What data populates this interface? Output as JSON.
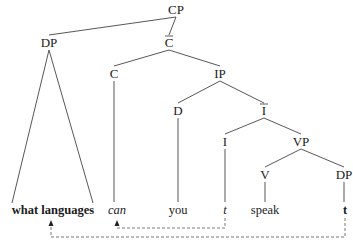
{
  "diagram": {
    "type": "syntax-tree",
    "nodes": [
      {
        "id": "CP",
        "label": "CP",
        "x": 176,
        "y": 14,
        "bar": false
      },
      {
        "id": "DP1",
        "label": "DP",
        "x": 49,
        "y": 47,
        "bar": false
      },
      {
        "id": "Cbar",
        "label": "C",
        "x": 169,
        "y": 47,
        "bar": true
      },
      {
        "id": "C",
        "label": "C",
        "x": 114,
        "y": 78,
        "bar": false
      },
      {
        "id": "IP",
        "label": "IP",
        "x": 220,
        "y": 78,
        "bar": false
      },
      {
        "id": "D",
        "label": "D",
        "x": 178,
        "y": 115,
        "bar": false
      },
      {
        "id": "Ibar",
        "label": "I",
        "x": 264,
        "y": 115,
        "bar": true
      },
      {
        "id": "I",
        "label": "I",
        "x": 225,
        "y": 146,
        "bar": false
      },
      {
        "id": "VP",
        "label": "VP",
        "x": 301,
        "y": 146,
        "bar": false
      },
      {
        "id": "V",
        "label": "V",
        "x": 265,
        "y": 179,
        "bar": false
      },
      {
        "id": "DP2",
        "label": "DP",
        "x": 344,
        "y": 179,
        "bar": false
      }
    ],
    "leaves": [
      {
        "id": "what-languages",
        "label": "what languages",
        "x": 53,
        "y": 214,
        "style": "bold"
      },
      {
        "id": "can",
        "label": "can",
        "x": 117,
        "y": 214,
        "style": "italic"
      },
      {
        "id": "you",
        "label": "you",
        "x": 178,
        "y": 214,
        "style": "normal"
      },
      {
        "id": "t-I",
        "label": "t",
        "x": 225,
        "y": 214,
        "style": "italic"
      },
      {
        "id": "speak",
        "label": "speak",
        "x": 265,
        "y": 214,
        "style": "normal"
      },
      {
        "id": "t-DP",
        "label": "t",
        "x": 345,
        "y": 214,
        "style": "bold"
      }
    ],
    "edges": [
      [
        "CP",
        "DP1"
      ],
      [
        "CP",
        "Cbar"
      ],
      [
        "Cbar",
        "C"
      ],
      [
        "Cbar",
        "IP"
      ],
      [
        "IP",
        "D"
      ],
      [
        "IP",
        "Ibar"
      ],
      [
        "Ibar",
        "I"
      ],
      [
        "Ibar",
        "VP"
      ],
      [
        "VP",
        "V"
      ],
      [
        "VP",
        "DP2"
      ]
    ],
    "triangle": {
      "apex": "DP1",
      "left_x": 12,
      "right_x": 93,
      "base_y": 203
    },
    "unary": [
      {
        "from": "C",
        "to": "can"
      },
      {
        "from": "D",
        "to": "you"
      },
      {
        "from": "I",
        "to": "t-I"
      },
      {
        "from": "V",
        "to": "speak"
      },
      {
        "from": "DP2",
        "to": "t-DP"
      }
    ],
    "movements": [
      {
        "from": "t-I",
        "to": "can",
        "line_y": 228,
        "label": "head movement I-to-C"
      },
      {
        "from": "t-DP",
        "to": "what-languages",
        "line_y": 237,
        "label": "wh-movement DP-to-SpecCP"
      }
    ]
  }
}
